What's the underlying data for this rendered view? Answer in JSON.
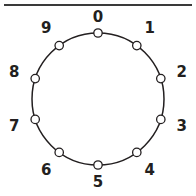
{
  "figure": {
    "rule": {
      "name": "top-horizontal-rule",
      "color": "#3a3a3a"
    },
    "colors": {
      "stroke": "#231f20",
      "node_fill": "#ffffff",
      "background": "#ffffff",
      "rule": "#3a3a3a"
    }
  },
  "chart_data": {
    "type": "scatter",
    "title": "",
    "subtitle": "",
    "xlabel": "",
    "ylabel": "",
    "layout": "circular",
    "grid": false,
    "legend": false,
    "center": {
      "x": 98,
      "y": 99
    },
    "radius": 66,
    "label_radius": 88,
    "node_count": 10,
    "direction": "clockwise",
    "start_angle_deg": -90,
    "categories": [
      "0",
      "1",
      "2",
      "3",
      "4",
      "5",
      "6",
      "7",
      "8",
      "9"
    ],
    "values": [
      0,
      1,
      2,
      3,
      4,
      5,
      6,
      7,
      8,
      9
    ],
    "nodes": [
      {
        "label": "0",
        "angle_deg": -90,
        "x": 98,
        "y": 33,
        "label_x": 98,
        "label_y": 17
      },
      {
        "label": "1",
        "angle_deg": -54,
        "x": 136.8,
        "y": 45.6,
        "label_x": 149.7,
        "label_y": 28.3
      },
      {
        "label": "2",
        "angle_deg": -18,
        "x": 160.8,
        "y": 78.6,
        "label_x": 181.7,
        "label_y": 71.8
      },
      {
        "label": "3",
        "angle_deg": 18,
        "x": 160.8,
        "y": 119.4,
        "label_x": 181.7,
        "label_y": 126.2
      },
      {
        "label": "4",
        "angle_deg": 54,
        "x": 136.8,
        "y": 152.4,
        "label_x": 149.7,
        "label_y": 169.8
      },
      {
        "label": "5",
        "angle_deg": 90,
        "x": 98,
        "y": 165,
        "label_x": 98,
        "label_y": 182
      },
      {
        "label": "6",
        "angle_deg": 126,
        "x": 59.2,
        "y": 152.4,
        "label_x": 46.3,
        "label_y": 169.8
      },
      {
        "label": "7",
        "angle_deg": 162,
        "x": 35.2,
        "y": 119.4,
        "label_x": 14.3,
        "label_y": 126.2
      },
      {
        "label": "8",
        "angle_deg": 198,
        "x": 35.2,
        "y": 78.6,
        "label_x": 14.3,
        "label_y": 71.8
      },
      {
        "label": "9",
        "angle_deg": 234,
        "x": 59.2,
        "y": 45.6,
        "label_x": 46.3,
        "label_y": 28.3
      }
    ]
  }
}
